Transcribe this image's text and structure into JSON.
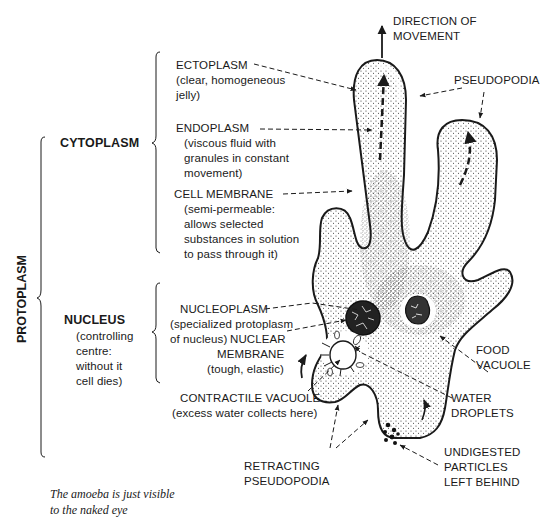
{
  "diagram": {
    "groups": {
      "protoplasm": "PROTOPLASM",
      "cytoplasm": "CYTOPLASM",
      "nucleus": {
        "title": "NUCLEUS",
        "desc": [
          "(controlling",
          "centre:",
          "without it",
          "cell dies)"
        ]
      }
    },
    "labels": {
      "direction": [
        "DIRECTION OF",
        "MOVEMENT"
      ],
      "ectoplasm": {
        "title": "ECTOPLASM",
        "desc": [
          "(clear, homogeneous",
          "jelly)"
        ]
      },
      "endoplasm": {
        "title": "ENDOPLASM",
        "desc": [
          "(viscous fluid with",
          "granules in constant",
          "movement)"
        ]
      },
      "cell_membrane": {
        "title": "CELL MEMBRANE",
        "desc": [
          "(semi-permeable:",
          "allows selected",
          "substances in solution",
          "to pass through it)"
        ]
      },
      "pseudopodia": "PSEUDOPODIA",
      "nucleoplasm": {
        "title": "NUCLEOPLASM",
        "desc": [
          "(specialized protoplasm",
          "of nucleus)"
        ]
      },
      "nuclear_membrane": {
        "title": [
          "NUCLEAR",
          "MEMBRANE"
        ],
        "desc": "(tough, elastic)"
      },
      "food_vacuole": [
        "FOOD",
        "VACUOLE"
      ],
      "contractile_vacuole": {
        "title": "CONTRACTILE VACUOLE",
        "desc": "(excess water collects here)"
      },
      "water_droplets": [
        "WATER",
        "DROPLETS"
      ],
      "retracting_pseudopodia": [
        "RETRACTING",
        "PSEUDOPODIA"
      ],
      "undigested": [
        "UNDIGESTED",
        "PARTICLES",
        "LEFT BEHIND"
      ]
    },
    "caption": [
      "The amoeba is just visible",
      "to the naked eye"
    ],
    "colors": {
      "ink": "#1a1a1a",
      "background": "#ffffff",
      "stipple": "#333333"
    }
  }
}
